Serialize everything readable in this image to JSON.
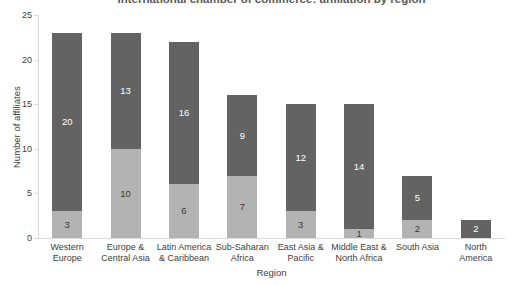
{
  "title": "International chamber of commerce: affiliation by region",
  "axes": {
    "x_label": "Region",
    "y_label": "Number of affiliates"
  },
  "colors": {
    "background": "#ffffff",
    "dark_segment": "#636363",
    "light_segment": "#b3b3b3",
    "axis_line": "#d9d9d9",
    "tick_text": "#404040",
    "title_text": "#595959",
    "label_on_dark": "#ffffff",
    "label_on_light": "#3a3a3a"
  },
  "chart_data": {
    "type": "bar",
    "stacked": true,
    "title": "International chamber of commerce: affiliation by region",
    "xlabel": "Region",
    "ylabel": "Number of affiliates",
    "ylim": [
      0,
      25
    ],
    "yticks": [
      0,
      5,
      10,
      15,
      20,
      25
    ],
    "grid": false,
    "legend": "none",
    "categories": [
      "Western Europe",
      "Europe & Central Asia",
      "Latin America & Caribbean",
      "Sub-Saharan Africa",
      "East Asia & Pacific",
      "Middle East & North Africa",
      "South Asia",
      "North America"
    ],
    "series": [
      {
        "name": "bottom light segment",
        "color": "#b3b3b3",
        "label_color": "#3a3a3a",
        "values": [
          3,
          10,
          6,
          7,
          3,
          1,
          2,
          0
        ]
      },
      {
        "name": "top dark segment",
        "color": "#636363",
        "label_color": "#ffffff",
        "values": [
          20,
          13,
          16,
          9,
          12,
          14,
          5,
          2
        ]
      }
    ],
    "totals": [
      23,
      23,
      22,
      16,
      15,
      15,
      7,
      2
    ]
  }
}
